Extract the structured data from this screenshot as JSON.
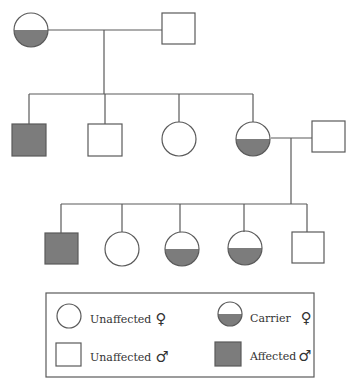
{
  "colors": {
    "line": "#5a5a5a",
    "affected_fill": "#7c7c7c",
    "background": "#ffffff"
  },
  "pedigree": {
    "generation_1": [
      {
        "id": "g1-female",
        "sex": "female",
        "status": "carrier"
      },
      {
        "id": "g1-male",
        "sex": "male",
        "status": "unaffected"
      }
    ],
    "generation_2": [
      {
        "id": "g2-son-1",
        "sex": "male",
        "status": "affected"
      },
      {
        "id": "g2-son-2",
        "sex": "male",
        "status": "unaffected"
      },
      {
        "id": "g2-daughter-1",
        "sex": "female",
        "status": "unaffected"
      },
      {
        "id": "g2-daughter-2",
        "sex": "female",
        "status": "carrier"
      },
      {
        "id": "g2-spouse",
        "sex": "male",
        "status": "unaffected"
      }
    ],
    "generation_3": [
      {
        "id": "g3-son-1",
        "sex": "male",
        "status": "affected"
      },
      {
        "id": "g3-daughter-1",
        "sex": "female",
        "status": "unaffected"
      },
      {
        "id": "g3-daughter-2",
        "sex": "female",
        "status": "carrier"
      },
      {
        "id": "g3-daughter-3",
        "sex": "female",
        "status": "carrier"
      },
      {
        "id": "g3-son-2",
        "sex": "male",
        "status": "unaffected"
      }
    ]
  },
  "legend": {
    "unaffected_female": {
      "label": "Unaffected",
      "symbol": "♀"
    },
    "carrier_female": {
      "label": "Carrier",
      "symbol": "♀"
    },
    "unaffected_male": {
      "label": "Unaffected",
      "symbol": "♂"
    },
    "affected_male": {
      "label": "Affected",
      "symbol": "♂"
    }
  }
}
